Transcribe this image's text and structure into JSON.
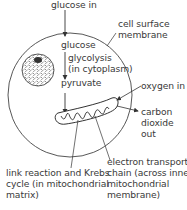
{
  "diagram": {
    "labels": {
      "glucose_in": "glucose in",
      "cell_surface_membrane_1": "cell surface",
      "cell_surface_membrane_2": "membrane",
      "glucose": "glucose",
      "glycolysis": "glycolysis",
      "in_cytoplasm": "(in cytoplasm)",
      "pyruvate": "pyruvate",
      "oxygen_in": "oxygen in",
      "co2_1": "carbon",
      "co2_2": "dioxide",
      "co2_3": "out",
      "link_1": "link reaction and Krebs",
      "link_2": "cycle (in mitochondrial",
      "link_3": "matrix)",
      "etc_1": "electron transport",
      "etc_2": "chain (across inner",
      "etc_3": "mitochondrial",
      "etc_4": "membrane)"
    },
    "colors": {
      "line": "#333333",
      "text": "#3a3a3a",
      "background": "#ffffff"
    }
  }
}
